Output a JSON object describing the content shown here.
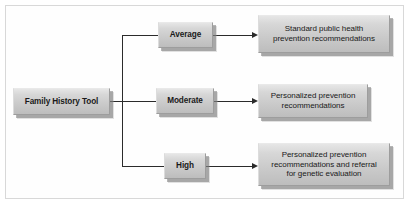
{
  "diagram": {
    "type": "flowchart",
    "orientation": "left-to-right",
    "colors": {
      "node_fill_light": "#e6e6e6",
      "node_fill_dark": "#bdbdbd",
      "node_border": "#9d9d9d",
      "connector": "#2b2b2b",
      "canvas": "#ffffff",
      "frame_border": "#d8d8d8"
    },
    "root": {
      "id": "family-history-tool",
      "label": "Family History Tool"
    },
    "levels": [
      {
        "id": "average",
        "label": "Average"
      },
      {
        "id": "moderate",
        "label": "Moderate"
      },
      {
        "id": "high",
        "label": "High"
      }
    ],
    "recommendations": [
      {
        "id": "rec-average",
        "lines": [
          "Standard public health",
          "prevention recommendations"
        ]
      },
      {
        "id": "rec-moderate",
        "lines": [
          "Personalized prevention",
          "recommendations"
        ]
      },
      {
        "id": "rec-high",
        "lines": [
          "Personalized prevention",
          "recommendations and referral",
          "for genetic evaluation"
        ]
      }
    ]
  }
}
